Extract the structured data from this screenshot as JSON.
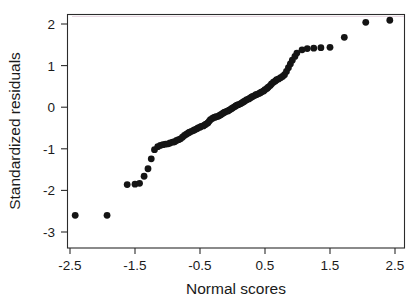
{
  "chart_data": {
    "type": "scatter",
    "title": "",
    "subtitle": "",
    "xlabel": "Normal scores",
    "ylabel": "Standardized  residuals",
    "xlim": [
      -2.75,
      2.75
    ],
    "ylim": [
      -3.32,
      2.32
    ],
    "xticks": [
      -2.5,
      -1.5,
      -0.5,
      0.5,
      1.5,
      2.5
    ],
    "xticklabels": [
      "-2.5",
      "-1.5",
      "-0.5",
      "0.5",
      "1.5",
      "2.5"
    ],
    "yticks": [
      2,
      1,
      0,
      -1,
      -2,
      -3
    ],
    "yticklabels": [
      "2",
      "1",
      "0",
      "-1",
      "-2",
      "-3"
    ],
    "grid": false,
    "legend": null,
    "marker": "filled-circle",
    "marker_color": "#141414",
    "marker_size": 3.4,
    "n_points": 101,
    "x": [
      -2.42,
      -1.93,
      -1.62,
      -1.5,
      -1.43,
      -1.36,
      -1.3,
      -1.25,
      -1.2,
      -1.15,
      -1.11,
      -1.07,
      -1.03,
      -0.99,
      -0.96,
      -0.92,
      -0.89,
      -0.86,
      -0.83,
      -0.8,
      -0.77,
      -0.74,
      -0.71,
      -0.68,
      -0.66,
      -0.63,
      -0.6,
      -0.58,
      -0.55,
      -0.53,
      -0.5,
      -0.48,
      -0.45,
      -0.43,
      -0.41,
      -0.38,
      -0.36,
      -0.34,
      -0.31,
      -0.29,
      -0.27,
      -0.25,
      -0.22,
      -0.2,
      -0.18,
      -0.16,
      -0.14,
      -0.12,
      -0.09,
      -0.07,
      -0.05,
      -0.03,
      -0.01,
      0.01,
      0.03,
      0.05,
      0.07,
      0.09,
      0.12,
      0.14,
      0.16,
      0.18,
      0.2,
      0.22,
      0.25,
      0.27,
      0.29,
      0.31,
      0.34,
      0.36,
      0.38,
      0.41,
      0.43,
      0.45,
      0.48,
      0.5,
      0.53,
      0.55,
      0.58,
      0.6,
      0.63,
      0.66,
      0.68,
      0.71,
      0.74,
      0.77,
      0.8,
      0.83,
      0.86,
      0.89,
      0.92,
      0.96,
      0.99,
      1.07,
      1.15,
      1.25,
      1.36,
      1.5,
      1.72,
      2.05,
      2.42
    ],
    "y": [
      -2.6,
      -2.6,
      -1.86,
      -1.85,
      -1.83,
      -1.66,
      -1.48,
      -1.24,
      -1.02,
      -0.95,
      -0.92,
      -0.9,
      -0.89,
      -0.88,
      -0.86,
      -0.84,
      -0.83,
      -0.8,
      -0.78,
      -0.76,
      -0.72,
      -0.68,
      -0.65,
      -0.62,
      -0.6,
      -0.58,
      -0.56,
      -0.54,
      -0.52,
      -0.5,
      -0.48,
      -0.46,
      -0.45,
      -0.43,
      -0.41,
      -0.38,
      -0.34,
      -0.3,
      -0.27,
      -0.25,
      -0.24,
      -0.23,
      -0.22,
      -0.2,
      -0.18,
      -0.16,
      -0.14,
      -0.12,
      -0.1,
      -0.09,
      -0.07,
      -0.05,
      -0.03,
      -0.01,
      0.01,
      0.03,
      0.05,
      0.06,
      0.08,
      0.1,
      0.12,
      0.14,
      0.16,
      0.18,
      0.2,
      0.22,
      0.24,
      0.26,
      0.28,
      0.3,
      0.31,
      0.33,
      0.35,
      0.37,
      0.39,
      0.42,
      0.45,
      0.48,
      0.52,
      0.56,
      0.6,
      0.63,
      0.66,
      0.68,
      0.71,
      0.74,
      0.78,
      0.86,
      0.95,
      1.04,
      1.13,
      1.22,
      1.3,
      1.38,
      1.41,
      1.42,
      1.43,
      1.44,
      1.68,
      2.04,
      2.09
    ]
  }
}
